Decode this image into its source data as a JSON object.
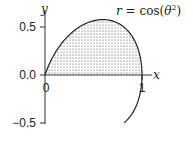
{
  "chart_data": {
    "type": "line",
    "title": "",
    "annotation": "r = cos(θ²)",
    "annotation_parts": {
      "lhs": "r",
      "eq": " = cos(",
      "theta": "θ",
      "sup": "2",
      "close": ")"
    },
    "xlabel": "x",
    "ylabel": "y",
    "x_ticks": [
      {
        "value": 0,
        "label": "0"
      },
      {
        "value": 1,
        "label": "1"
      }
    ],
    "y_ticks": [
      {
        "value": 0.5,
        "label": "0.5"
      },
      {
        "value": 0.0,
        "label": "0.0"
      },
      {
        "value": -0.5,
        "label": "−0.5"
      }
    ],
    "xlim": [
      -0.1,
      1.05
    ],
    "ylim": [
      -0.5,
      0.6
    ],
    "grid": false,
    "legend": null,
    "curve": {
      "equation": "r = cos(theta^2)",
      "theta_range": [
        -0.55,
        1.2533
      ],
      "shaded_region": "area enclosed between curve and x-axis for y >= 0 (stippled)",
      "points": [
        {
          "x": -0.07,
          "y": -0.42
        },
        {
          "x": -0.03,
          "y": -0.2
        },
        {
          "x": 0.0,
          "y": 0.0
        },
        {
          "x": 0.08,
          "y": 0.2
        },
        {
          "x": 0.2,
          "y": 0.38
        },
        {
          "x": 0.35,
          "y": 0.5
        },
        {
          "x": 0.5,
          "y": 0.56
        },
        {
          "x": 0.65,
          "y": 0.55
        },
        {
          "x": 0.8,
          "y": 0.47
        },
        {
          "x": 0.92,
          "y": 0.32
        },
        {
          "x": 0.99,
          "y": 0.12
        },
        {
          "x": 1.0,
          "y": 0.0
        }
      ]
    }
  },
  "colors": {
    "line": "#222222",
    "fill_dots": "#444444",
    "background": "#ffffff"
  }
}
